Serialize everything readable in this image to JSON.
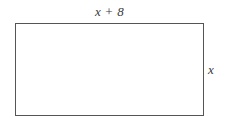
{
  "figure": {
    "kind": "rectangle-diagram",
    "shape_name": "rectangle",
    "colors": {
      "stroke": "#555555",
      "fill": "#ffffff",
      "text": "#3a3a3a",
      "background": "#ffffff"
    },
    "labels": {
      "top": "x + 8",
      "right": "x"
    },
    "geometry": {
      "left": 15,
      "top": 23,
      "width": 189,
      "height": 93
    }
  }
}
